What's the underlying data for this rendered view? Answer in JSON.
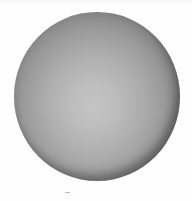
{
  "image": {
    "subject": "gray shaded sphere",
    "background_color": "#ffffff",
    "sphere": {
      "center": [
        97,
        97
      ],
      "radius_x": 83,
      "radius_y": 84,
      "highlight_color": "#c4c4c4",
      "edge_color": "#3a3a3a"
    }
  }
}
